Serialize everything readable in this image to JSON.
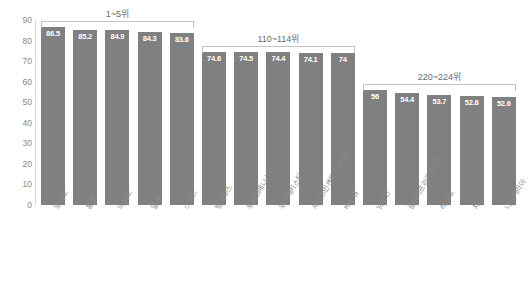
{
  "chart_data": {
    "type": "bar",
    "title": "",
    "subtitle": "",
    "xlabel": "",
    "ylabel": "",
    "ylim": [
      0,
      90
    ],
    "ytick_step": 10,
    "yticks": [
      "90",
      "80",
      "70",
      "60",
      "50",
      "40",
      "30",
      "20",
      "10",
      "0"
    ],
    "grid": false,
    "legend": false,
    "bar_color": "#808080",
    "value_label_color": "#ffffff",
    "axis_text_color": "#8a8a8a",
    "background": "#ffffff",
    "categories": [
      "모나코",
      "홍콩",
      "마카오",
      "일본",
      "스위스",
      "벨라루스",
      "투르크메니스탄",
      "우즈베키스탄",
      "세인트빈센트그레나딘",
      "베트남",
      "남수단",
      "중앙아프리카공화국",
      "레소토",
      "차드",
      "나이지리아"
    ],
    "values": [
      86.5,
      85.2,
      84.9,
      84.3,
      83.6,
      74.6,
      74.5,
      74.4,
      74.1,
      74,
      56,
      54.4,
      53.7,
      52.8,
      52.6
    ],
    "value_labels": [
      "86.5",
      "85.2",
      "84.9",
      "84.3",
      "83.6",
      "74.6",
      "74.5",
      "74.4",
      "74.1",
      "74",
      "56",
      "54.4",
      "53.7",
      "52.8",
      "52.6"
    ],
    "annotations": [
      {
        "label": "1~5위",
        "start_index": 0,
        "end_index": 4
      },
      {
        "label": "110~114위",
        "start_index": 5,
        "end_index": 9
      },
      {
        "label": "220~224위",
        "start_index": 10,
        "end_index": 14
      }
    ]
  }
}
